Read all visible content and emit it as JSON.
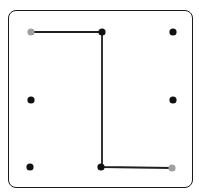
{
  "diagram": {
    "type": "dot-grid-path",
    "grid": {
      "rows": 3,
      "cols": 3
    },
    "colors": {
      "frame": "#1a1a1a",
      "dot": "#111111",
      "endpoint": "#a0a0a0",
      "line": "#1e1e1e"
    },
    "dots": [
      {
        "id": "r0c0",
        "x": 31,
        "y": 32,
        "role": "endpoint"
      },
      {
        "id": "r0c1",
        "x": 102,
        "y": 32,
        "role": "dot"
      },
      {
        "id": "r0c2",
        "x": 173,
        "y": 32,
        "role": "dot"
      },
      {
        "id": "r1c0",
        "x": 31,
        "y": 100,
        "role": "dot"
      },
      {
        "id": "r1c2",
        "x": 173,
        "y": 100,
        "role": "dot"
      },
      {
        "id": "r2c0",
        "x": 30,
        "y": 167,
        "role": "dot"
      },
      {
        "id": "r2c1",
        "x": 101,
        "y": 167,
        "role": "dot"
      },
      {
        "id": "r2c2",
        "x": 172,
        "y": 168,
        "role": "endpoint"
      }
    ],
    "path": [
      {
        "x": 31,
        "y": 32
      },
      {
        "x": 102,
        "y": 32
      },
      {
        "x": 102,
        "y": 167
      },
      {
        "x": 172,
        "y": 168
      }
    ]
  }
}
